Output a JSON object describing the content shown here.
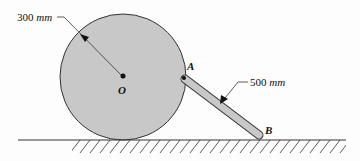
{
  "diagram": {
    "labels": {
      "radius_value": "300",
      "radius_unit": "mm",
      "rod_value": "500",
      "rod_unit": "mm",
      "center": "O",
      "point_a": "A",
      "point_b": "B"
    },
    "colors": {
      "disk_fill": "#c8c8c8",
      "rod_fill": "#c8c8c8",
      "stroke": "#333333"
    }
  }
}
